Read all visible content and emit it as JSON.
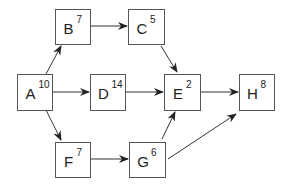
{
  "diagram": {
    "type": "activity-network",
    "nodes": [
      {
        "id": "A",
        "label": "A",
        "value": "10",
        "x": 17,
        "y": 74,
        "w": 35,
        "h": 36
      },
      {
        "id": "B",
        "label": "B",
        "value": "7",
        "x": 55,
        "y": 9,
        "w": 35,
        "h": 35
      },
      {
        "id": "C",
        "label": "C",
        "value": "5",
        "x": 128,
        "y": 9,
        "w": 36,
        "h": 35
      },
      {
        "id": "D",
        "label": "D",
        "value": "14",
        "x": 90,
        "y": 74,
        "w": 35,
        "h": 36
      },
      {
        "id": "E",
        "label": "E",
        "value": "2",
        "x": 164,
        "y": 74,
        "w": 36,
        "h": 36
      },
      {
        "id": "F",
        "label": "F",
        "value": "7",
        "x": 55,
        "y": 142,
        "w": 35,
        "h": 35
      },
      {
        "id": "G",
        "label": "G",
        "value": "6",
        "x": 129,
        "y": 142,
        "w": 36,
        "h": 35
      },
      {
        "id": "H",
        "label": "H",
        "value": "8",
        "x": 239,
        "y": 74,
        "w": 35,
        "h": 36
      }
    ],
    "edges": [
      {
        "from": "A",
        "to": "B",
        "x1": 46,
        "y1": 74,
        "x2": 61,
        "y2": 46
      },
      {
        "from": "A",
        "to": "D",
        "x1": 52,
        "y1": 92,
        "x2": 89,
        "y2": 92
      },
      {
        "from": "A",
        "to": "F",
        "x1": 46,
        "y1": 110,
        "x2": 61,
        "y2": 140
      },
      {
        "from": "B",
        "to": "C",
        "x1": 90,
        "y1": 26,
        "x2": 127,
        "y2": 26
      },
      {
        "from": "C",
        "to": "E",
        "x1": 161,
        "y1": 46,
        "x2": 177,
        "y2": 72
      },
      {
        "from": "D",
        "to": "E",
        "x1": 125,
        "y1": 92,
        "x2": 163,
        "y2": 92
      },
      {
        "from": "E",
        "to": "H",
        "x1": 200,
        "y1": 92,
        "x2": 238,
        "y2": 92
      },
      {
        "from": "F",
        "to": "G",
        "x1": 90,
        "y1": 159,
        "x2": 128,
        "y2": 159
      },
      {
        "from": "G",
        "to": "E",
        "x1": 162,
        "y1": 139,
        "x2": 175,
        "y2": 112
      },
      {
        "from": "G",
        "to": "H",
        "x1": 168,
        "y1": 159,
        "x2": 236,
        "y2": 114
      }
    ],
    "colors": {
      "stroke": "#555555",
      "edge": "#333333",
      "text": "#222222",
      "background": "#ffffff"
    }
  }
}
